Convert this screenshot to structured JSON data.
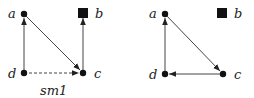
{
  "graphs": [
    {
      "id": "left",
      "nodes": {
        "a": {
          "label": "a",
          "x": 24,
          "y": 14,
          "shape": "circle"
        },
        "b": {
          "label": "b",
          "x": 83,
          "y": 13,
          "shape": "square"
        },
        "c": {
          "label": "c",
          "x": 83,
          "y": 73,
          "shape": "circle"
        },
        "d": {
          "label": "d",
          "x": 24,
          "y": 73,
          "shape": "circle"
        }
      },
      "edges": [
        {
          "from": "d",
          "to": "a",
          "style": "solid"
        },
        {
          "from": "a",
          "to": "c",
          "style": "solid"
        },
        {
          "from": "c",
          "to": "b",
          "style": "solid"
        },
        {
          "from": "d",
          "to": "c",
          "style": "dashed"
        }
      ],
      "caption": "sm1"
    },
    {
      "id": "right",
      "nodes": {
        "a": {
          "label": "a",
          "x": 165,
          "y": 14,
          "shape": "circle"
        },
        "b": {
          "label": "b",
          "x": 222,
          "y": 13,
          "shape": "square"
        },
        "c": {
          "label": "c",
          "x": 223,
          "y": 74,
          "shape": "circle"
        },
        "d": {
          "label": "d",
          "x": 165,
          "y": 74,
          "shape": "circle"
        }
      },
      "edges": [
        {
          "from": "d",
          "to": "a",
          "style": "solid"
        },
        {
          "from": "a",
          "to": "c",
          "style": "solid"
        },
        {
          "from": "c",
          "to": "d",
          "style": "solid"
        }
      ]
    }
  ],
  "labels": {
    "left_a": "a",
    "left_b": "b",
    "left_c": "c",
    "left_d": "d",
    "left_caption": "sm1",
    "right_a": "a",
    "right_b": "b",
    "right_c": "c",
    "right_d": "d"
  }
}
